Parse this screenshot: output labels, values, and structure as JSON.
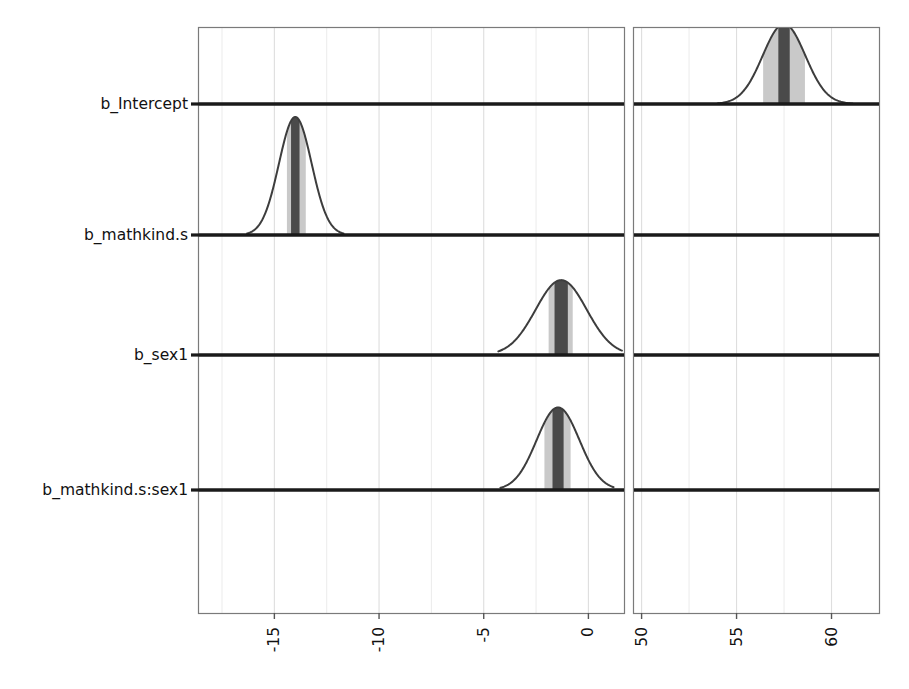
{
  "chart_data": {
    "type": "area",
    "title": "",
    "subtitle": "",
    "xlabel": "",
    "ylabel": "",
    "grid": true,
    "legend": null,
    "style": "ridgeline posterior density with median band and inner interval shading",
    "panels": [
      {
        "name": "left-panel",
        "xlim": [
          -18.6,
          1.7
        ],
        "ticks": [
          -15,
          -10,
          -5,
          0
        ],
        "tick_labels": [
          "-15",
          "-10",
          "-5",
          "0"
        ],
        "minor_ticks": [
          -17.5,
          -12.5,
          -7.5,
          -2.5
        ]
      },
      {
        "name": "right-panel",
        "xlim": [
          49.6,
          62.5
        ],
        "ticks": [
          50,
          55,
          60
        ],
        "tick_labels": [
          "50",
          "55",
          "60"
        ],
        "minor_ticks": [
          52.5,
          57.5
        ]
      }
    ],
    "categories": [
      "b_Intercept",
      "b_mathkind.s",
      "b_sex1",
      "b_mathkind.s:sex1"
    ],
    "series": [
      {
        "name": "b_Intercept",
        "panel": "right-panel",
        "median": 57.5,
        "sd": 1.12,
        "inner_interval": [
          56.4,
          58.6
        ],
        "outer_range": [
          54.0,
          61.1
        ],
        "peak_height": 1.0,
        "clipped_top": true
      },
      {
        "name": "b_mathkind.s",
        "panel": "left-panel",
        "median": -14.0,
        "sd": 0.78,
        "inner_interval": [
          -14.4,
          -13.5
        ],
        "outer_range": [
          -16.3,
          -11.7
        ],
        "peak_height": 1.0,
        "clipped_top": false
      },
      {
        "name": "b_sex1",
        "panel": "left-panel",
        "median": -1.3,
        "sd": 1.22,
        "inner_interval": [
          -1.9,
          -0.75
        ],
        "outer_range": [
          -4.3,
          1.6
        ],
        "peak_height": 0.78,
        "clipped_top": false
      },
      {
        "name": "b_mathkind.s:sex1",
        "panel": "left-panel",
        "median": -1.45,
        "sd": 1.02,
        "inner_interval": [
          -2.1,
          -0.85
        ],
        "outer_range": [
          -4.2,
          1.2
        ],
        "peak_height": 0.86,
        "clipped_top": false
      }
    ]
  },
  "axis": {
    "y_labels": [
      "b_Intercept",
      "b_mathkind.s",
      "b_sex1",
      "b_mathkind.s:sex1"
    ],
    "x_tick_labels_left": [
      "-15",
      "-10",
      "-5",
      "0"
    ],
    "x_tick_labels_right": [
      "50",
      "55",
      "60"
    ]
  },
  "colors": {
    "background": "#ffffff",
    "panel_border": "#7a7a7a",
    "baseline": "#1a1a1a",
    "density_line": "#3d3d3d",
    "band_inner": "#c9c9c9",
    "band_median": "#4a4a4a",
    "gridline_major": "#dedede",
    "gridline_minor": "#ebebeb",
    "text": "#111111"
  }
}
